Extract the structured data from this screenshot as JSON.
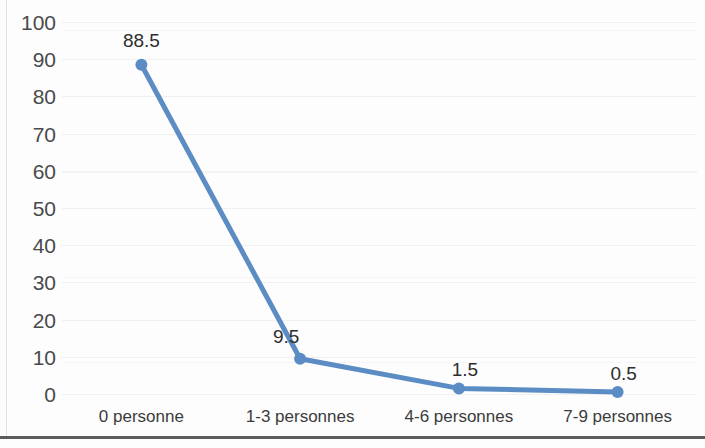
{
  "chart_data": {
    "type": "line",
    "title": "",
    "subtitle": "",
    "xlabel": "",
    "ylabel": "",
    "categories": [
      "0 personne",
      "1-3 personnes",
      "4-6 personnes",
      "7-9 personnes"
    ],
    "values": [
      88.5,
      9.5,
      1.5,
      0.5
    ],
    "data_labels": [
      "88.5",
      "9.5",
      "1.5",
      "0.5"
    ],
    "series": [
      {
        "name": "",
        "values": [
          88.5,
          9.5,
          1.5,
          0.5
        ],
        "color": "#5b8cc4",
        "marker": "circle"
      }
    ],
    "ylim": [
      0,
      100
    ],
    "ytick_step": 10,
    "ytick_labels": [
      "100",
      "90",
      "80",
      "70",
      "60",
      "50",
      "40",
      "30",
      "20",
      "10",
      "0"
    ],
    "grid": true,
    "grid_axis": "y",
    "grid_color": "#f0f0f2",
    "legend": false,
    "legend_position": "none",
    "plot_background": "#fdfdfd",
    "line_color": "#5b8cc4",
    "marker_color": "#5b8cc4",
    "axis_border_color": "#3f3f3f"
  }
}
